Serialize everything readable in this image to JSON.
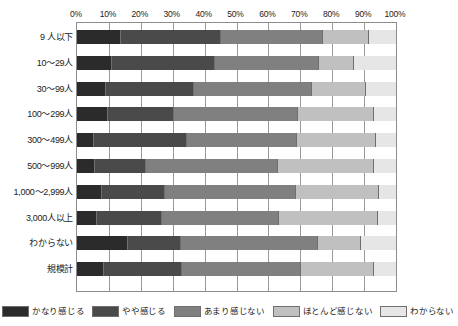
{
  "chart_data": {
    "type": "bar",
    "orientation": "horizontal",
    "stacked": true,
    "normalized_percent": true,
    "title": "",
    "xlabel": "",
    "ylabel": "",
    "xlim": [
      0,
      100
    ],
    "grid": true,
    "legend_position": "bottom",
    "xticks": [
      "0%",
      "10%",
      "20%",
      "30%",
      "40%",
      "50%",
      "60%",
      "70%",
      "80%",
      "90%",
      "100%"
    ],
    "xtick_values": [
      0,
      10,
      20,
      30,
      40,
      50,
      60,
      70,
      80,
      90,
      100
    ],
    "categories": [
      "9 人以下",
      "10～29人",
      "30～99人",
      "100～299人",
      "300～499人",
      "500～999人",
      "1,000～2,999人",
      "3,000人以上",
      "わからない",
      "規模計"
    ],
    "series": [
      {
        "name": "かなり感じる",
        "color": "#2b2b2b",
        "values": [
          13.8,
          11.0,
          9.0,
          9.7,
          5.3,
          5.6,
          7.8,
          6.3,
          16.0,
          8.5
        ]
      },
      {
        "name": "やや感じる",
        "color": "#4a4a4a",
        "values": [
          31.2,
          32.3,
          27.6,
          20.7,
          29.2,
          16.0,
          19.7,
          20.4,
          16.6,
          24.4
        ]
      },
      {
        "name": "あまり感じない",
        "color": "#808080",
        "values": [
          32.1,
          32.6,
          37.0,
          38.9,
          34.5,
          41.4,
          41.1,
          36.7,
          43.0,
          37.3
        ]
      },
      {
        "name": "ほとんど感じない",
        "color": "#c0c0c0",
        "values": [
          14.4,
          11.0,
          16.9,
          23.8,
          24.8,
          30.1,
          26.0,
          31.0,
          13.5,
          22.9
        ]
      },
      {
        "name": "わからない",
        "color": "#e6e6e6",
        "values": [
          8.5,
          13.1,
          9.5,
          6.9,
          6.2,
          6.9,
          5.4,
          5.6,
          10.9,
          6.9
        ]
      }
    ]
  }
}
